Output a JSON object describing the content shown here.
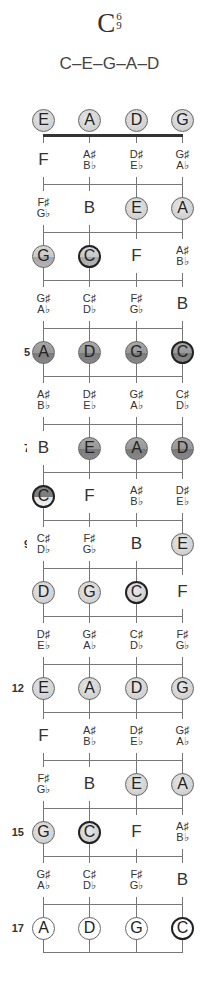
{
  "title": {
    "root": "C",
    "ext_top": "6",
    "ext_bottom": "9"
  },
  "notes_formula": "C–E–G–A–D",
  "strings_x": [
    43,
    89,
    136,
    182
  ],
  "nut_y": 136,
  "fret_spacing": 48,
  "fret_count": 17,
  "fret_markers": [
    {
      "fret": 5,
      "label": "5"
    },
    {
      "fret": 7,
      "label": "7"
    },
    {
      "fret": 9,
      "label": "9"
    },
    {
      "fret": 12,
      "label": "12"
    },
    {
      "fret": 15,
      "label": "15"
    },
    {
      "fret": 17,
      "label": "17"
    }
  ],
  "rows": [
    {
      "fret": 0,
      "cells": [
        {
          "n": "E",
          "s": "light"
        },
        {
          "n": "A",
          "s": "light"
        },
        {
          "n": "D",
          "s": "light"
        },
        {
          "n": "G",
          "s": "light"
        }
      ]
    },
    {
      "fret": 1,
      "cells": [
        {
          "t": "F"
        },
        {
          "a": [
            "A♯",
            "B♭"
          ]
        },
        {
          "a": [
            "D♯",
            "E♭"
          ]
        },
        {
          "a": [
            "G♯",
            "A♭"
          ]
        }
      ]
    },
    {
      "fret": 2,
      "cells": [
        {
          "a": [
            "F♯",
            "G♭"
          ]
        },
        {
          "t": "B"
        },
        {
          "n": "E",
          "s": "light"
        },
        {
          "n": "A",
          "s": "light"
        }
      ]
    },
    {
      "fret": 3,
      "cells": [
        {
          "n": "G",
          "s": "mid"
        },
        {
          "n": "C",
          "s": "mid",
          "root": true
        },
        {
          "t": "F"
        },
        {
          "a": [
            "A♯",
            "B♭"
          ]
        }
      ]
    },
    {
      "fret": 4,
      "cells": [
        {
          "a": [
            "G♯",
            "A♭"
          ]
        },
        {
          "a": [
            "C♯",
            "D♭"
          ]
        },
        {
          "a": [
            "F♯",
            "G♭"
          ]
        },
        {
          "t": "B"
        }
      ]
    },
    {
      "fret": 5,
      "cells": [
        {
          "n": "A",
          "s": "dark"
        },
        {
          "n": "D",
          "s": "dark"
        },
        {
          "n": "G",
          "s": "dark"
        },
        {
          "n": "C",
          "s": "dark",
          "root": true
        }
      ]
    },
    {
      "fret": 6,
      "cells": [
        {
          "a": [
            "A♯",
            "B♭"
          ]
        },
        {
          "a": [
            "D♯",
            "E♭"
          ]
        },
        {
          "a": [
            "G♯",
            "A♭"
          ]
        },
        {
          "a": [
            "C♯",
            "D♭"
          ]
        }
      ]
    },
    {
      "fret": 7,
      "cells": [
        {
          "t": "B"
        },
        {
          "n": "E",
          "s": "dark"
        },
        {
          "n": "A",
          "s": "dark"
        },
        {
          "n": "D",
          "s": "dark"
        }
      ]
    },
    {
      "fret": 8,
      "cells": [
        {
          "n": "C",
          "s": "split",
          "root": true
        },
        {
          "t": "F"
        },
        {
          "a": [
            "A♯",
            "B♭"
          ]
        },
        {
          "a": [
            "D♯",
            "E♭"
          ]
        }
      ]
    },
    {
      "fret": 9,
      "cells": [
        {
          "a": [
            "C♯",
            "D♭"
          ]
        },
        {
          "a": [
            "F♯",
            "G♭"
          ]
        },
        {
          "t": "B"
        },
        {
          "n": "E",
          "s": "light"
        }
      ]
    },
    {
      "fret": 10,
      "cells": [
        {
          "n": "D",
          "s": "light"
        },
        {
          "n": "G",
          "s": "light"
        },
        {
          "n": "C",
          "s": "light",
          "root": true
        },
        {
          "t": "F"
        }
      ]
    },
    {
      "fret": 11,
      "cells": [
        {
          "a": [
            "D♯",
            "E♭"
          ]
        },
        {
          "a": [
            "G♯",
            "A♭"
          ]
        },
        {
          "a": [
            "C♯",
            "D♭"
          ]
        },
        {
          "a": [
            "F♯",
            "G♭"
          ]
        }
      ]
    },
    {
      "fret": 12,
      "cells": [
        {
          "n": "E",
          "s": "light"
        },
        {
          "n": "A",
          "s": "light"
        },
        {
          "n": "D",
          "s": "light"
        },
        {
          "n": "G",
          "s": "light"
        }
      ]
    },
    {
      "fret": 13,
      "cells": [
        {
          "t": "F"
        },
        {
          "a": [
            "A♯",
            "B♭"
          ]
        },
        {
          "a": [
            "D♯",
            "E♭"
          ]
        },
        {
          "a": [
            "G♯",
            "A♭"
          ]
        }
      ]
    },
    {
      "fret": 14,
      "cells": [
        {
          "a": [
            "F♯",
            "G♭"
          ]
        },
        {
          "t": "B"
        },
        {
          "n": "E",
          "s": "light"
        },
        {
          "n": "A",
          "s": "light"
        }
      ]
    },
    {
      "fret": 15,
      "cells": [
        {
          "n": "G",
          "s": "light"
        },
        {
          "n": "C",
          "s": "light",
          "root": true
        },
        {
          "t": "F"
        },
        {
          "a": [
            "A♯",
            "B♭"
          ]
        }
      ]
    },
    {
      "fret": 16,
      "cells": [
        {
          "a": [
            "G♯",
            "A♭"
          ]
        },
        {
          "a": [
            "C♯",
            "D♭"
          ]
        },
        {
          "a": [
            "F♯",
            "G♭"
          ]
        },
        {
          "t": "B"
        }
      ]
    },
    {
      "fret": 17,
      "cells": [
        {
          "n": "A",
          "s": "white"
        },
        {
          "n": "D",
          "s": "white"
        },
        {
          "n": "G",
          "s": "white"
        },
        {
          "n": "C",
          "s": "white",
          "root": true
        }
      ]
    }
  ],
  "legend": {
    "styles": {
      "light": "light gray chord tone",
      "mid": "gray chord tone",
      "dark": "dark gray chord tone",
      "split": "half dark / half light chord tone",
      "white": "outlined chord tone"
    },
    "root_note": "C (thick outline)"
  }
}
